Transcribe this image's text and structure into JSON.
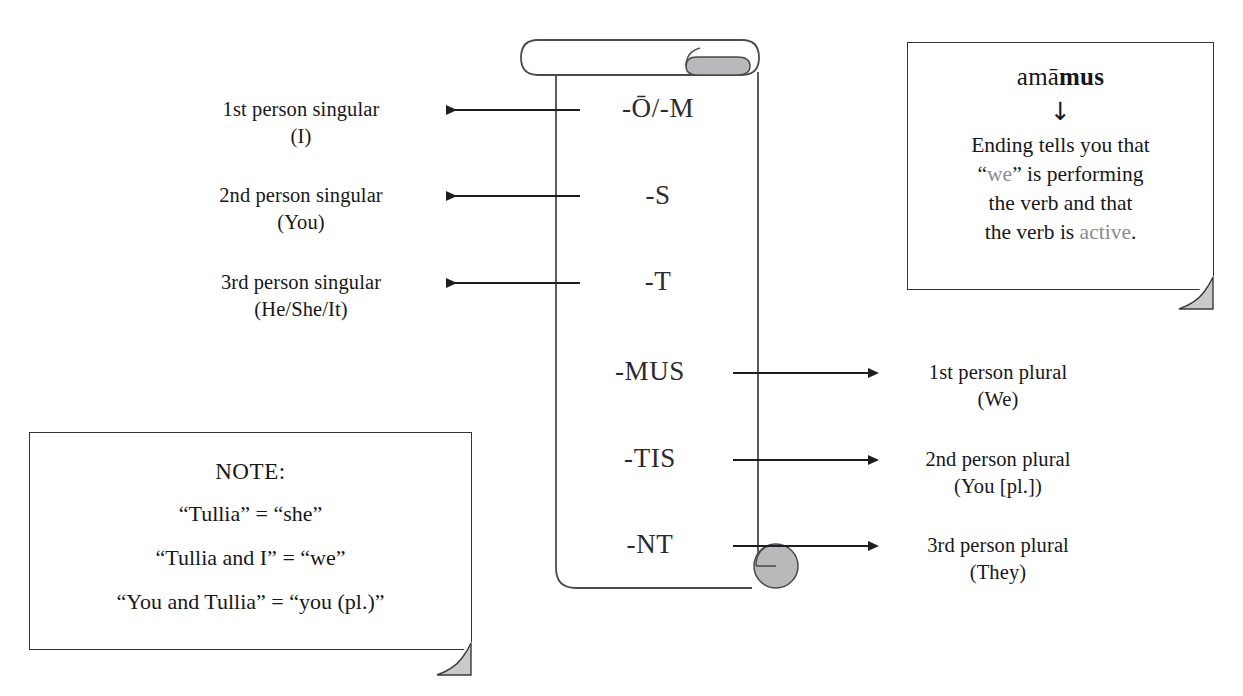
{
  "scroll": {
    "name": "latin-active-personal-endings-scroll",
    "endings": [
      {
        "id": "first-singular",
        "text": "-Ō/-M",
        "side": "left"
      },
      {
        "id": "second-singular",
        "text": "-S",
        "side": "left"
      },
      {
        "id": "third-singular",
        "text": "-T",
        "side": "left"
      },
      {
        "id": "first-plural",
        "text": "-MUS",
        "side": "right"
      },
      {
        "id": "second-plural",
        "text": "-TIS",
        "side": "right"
      },
      {
        "id": "third-plural",
        "text": "-NT",
        "side": "right"
      }
    ]
  },
  "left_labels": [
    {
      "line1": "1st person singular",
      "line2": "(I)"
    },
    {
      "line1": "2nd person singular",
      "line2": "(You)"
    },
    {
      "line1": "3rd person singular",
      "line2": "(He/She/It)"
    }
  ],
  "right_labels": [
    {
      "line1": "1st person plural",
      "line2": "(We)"
    },
    {
      "line1": "2nd person plural",
      "line2": "(You [pl.])"
    },
    {
      "line1": "3rd person plural",
      "line2": "(They)"
    }
  ],
  "verb_box": {
    "headword_plain": "amā",
    "headword_bold": "mus",
    "arrow": "↓",
    "body_line1": "Ending tells you that",
    "body_quote_open": "“",
    "body_gray_1": "we",
    "body_quote_close": "”",
    "body_line2_rest": " is performing",
    "body_line3": "the verb and that",
    "body_line4_pre": "the verb is ",
    "body_gray_2": "active",
    "body_line4_post": "."
  },
  "note_box": {
    "title": "NOTE:",
    "lines": [
      "“Tullia” = “she”",
      "“Tullia and I” = “we”",
      "“You and Tullia” = “you (pl.)”"
    ]
  },
  "colors": {
    "ink": "#17171a",
    "line": "#33333a",
    "roll_fill": "#b9b9b9",
    "fold_fill": "#c9c9c9",
    "gray_text": "#8b8b90",
    "paper": "#ffffff"
  }
}
